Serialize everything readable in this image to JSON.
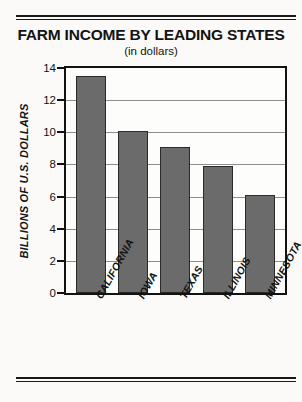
{
  "chart_data": {
    "type": "bar",
    "title": "FARM INCOME BY LEADING STATES",
    "subtitle": "(in dollars)",
    "xlabel": "",
    "ylabel": "BILLIONS OF U.S. DOLLARS",
    "categories": [
      "CALIFORNIA",
      "IOWA",
      "TEXAS",
      "ILLINOIS",
      "MINNESOTA"
    ],
    "values": [
      13.5,
      10.1,
      9.1,
      7.9,
      6.1
    ],
    "ylim": [
      0,
      14
    ],
    "yticks": [
      0,
      2,
      4,
      6,
      8,
      10,
      12,
      14
    ],
    "ytick_labels": [
      "0",
      "2",
      "4",
      "6",
      "8",
      "10",
      "12",
      "14"
    ],
    "grid": true,
    "legend": false,
    "bar_color": "#6b6b6b",
    "bar_edge_color": "#2a2a2a",
    "axis_color": "#121212",
    "background_color": "#fbfaf8"
  }
}
